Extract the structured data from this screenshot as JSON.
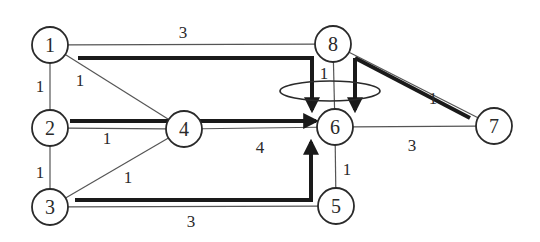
{
  "diagram": {
    "type": "weighted-graph-with-paths",
    "colors": {
      "background": "#ffffff",
      "stroke": "#2a2a2a",
      "thin_edge": "#555555",
      "path": "#1a1a1a"
    },
    "nodes": [
      {
        "id": "1",
        "label": "1",
        "x": 50,
        "y": 45
      },
      {
        "id": "2",
        "label": "2",
        "x": 50,
        "y": 128
      },
      {
        "id": "3",
        "label": "3",
        "x": 50,
        "y": 207
      },
      {
        "id": "4",
        "label": "4",
        "x": 184,
        "y": 129
      },
      {
        "id": "5",
        "label": "5",
        "x": 336,
        "y": 206
      },
      {
        "id": "6",
        "label": "6",
        "x": 335,
        "y": 127
      },
      {
        "id": "7",
        "label": "7",
        "x": 494,
        "y": 126
      },
      {
        "id": "8",
        "label": "8",
        "x": 333,
        "y": 44
      }
    ],
    "edges": [
      {
        "from": "1",
        "to": "8",
        "weight": "3",
        "label_x": 183,
        "label_y": 38
      },
      {
        "from": "1",
        "to": "2",
        "weight": "1",
        "label_x": 40,
        "label_y": 92
      },
      {
        "from": "1",
        "to": "4",
        "weight": "1",
        "label_x": 80,
        "label_y": 86
      },
      {
        "from": "2",
        "to": "4",
        "weight": "1",
        "label_x": 107,
        "label_y": 144
      },
      {
        "from": "2",
        "to": "3",
        "weight": "1",
        "label_x": 40,
        "label_y": 178
      },
      {
        "from": "3",
        "to": "4",
        "weight": "1",
        "label_x": 128,
        "label_y": 183
      },
      {
        "from": "4",
        "to": "6",
        "weight": "4",
        "label_x": 260,
        "label_y": 153
      },
      {
        "from": "3",
        "to": "5",
        "weight": "3",
        "label_x": 191,
        "label_y": 227
      },
      {
        "from": "8",
        "to": "6",
        "weight": "1",
        "label_x": 324,
        "label_y": 79
      },
      {
        "from": "8",
        "to": "7",
        "weight": "1",
        "label_x": 433,
        "label_y": 104
      },
      {
        "from": "6",
        "to": "7",
        "weight": "3",
        "label_x": 412,
        "label_y": 151
      },
      {
        "from": "6",
        "to": "5",
        "weight": "1",
        "label_x": 347,
        "label_y": 175
      }
    ],
    "paths": [
      {
        "name": "path-1-to-6",
        "points": "78,58 312,58 312,110",
        "arrow": true
      },
      {
        "name": "path-2-to-6",
        "points": "70,121 316,121",
        "arrow": true
      },
      {
        "name": "path-3-to-6",
        "points": "75,200 311,200 311,142",
        "arrow": true
      },
      {
        "name": "path-8-to-6",
        "points": "355,58 355,110",
        "arrow": true
      },
      {
        "name": "path-8-to-7",
        "points": "355,58 470,118",
        "arrow": false
      }
    ],
    "ellipse": {
      "cx": 330,
      "cy": 91,
      "rx": 50,
      "ry": 10
    }
  }
}
